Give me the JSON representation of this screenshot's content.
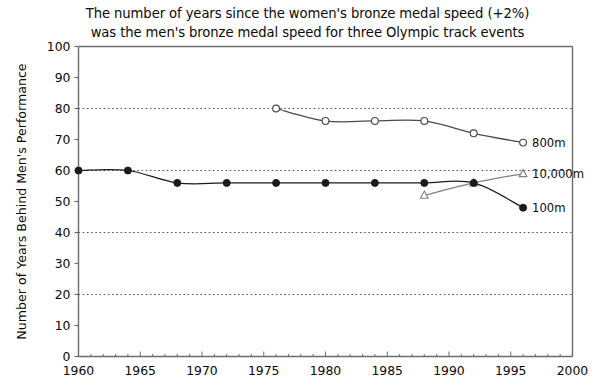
{
  "chart_data": {
    "type": "line",
    "title": "The number of years since the women's bronze medal speed (+2%) was the men's bronze medal speed for three Olympic track events",
    "title_lines": [
      "The number of years since the women's bronze medal speed (+2%)",
      "was the men's bronze medal speed for three Olympic track events"
    ],
    "xlabel": "",
    "ylabel": "Number of Years Behind Men's Performance",
    "xlim": [
      1960,
      2000
    ],
    "ylim": [
      0,
      100
    ],
    "xticks": [
      1960,
      1965,
      1970,
      1975,
      1980,
      1985,
      1990,
      1995,
      2000
    ],
    "xtick_labels": [
      "1960",
      "1965",
      "1970",
      "1975",
      "1980",
      "1985",
      "1990",
      "1995",
      "2000"
    ],
    "x_minor_tick_step": 1,
    "yticks": [
      0,
      10,
      20,
      30,
      40,
      50,
      60,
      70,
      80,
      90,
      100
    ],
    "ytick_labels": [
      "0",
      "10",
      "20",
      "30",
      "40",
      "50",
      "60",
      "70",
      "80",
      "90",
      "100"
    ],
    "gridlines_y": [
      20,
      40,
      60,
      80
    ],
    "grid": "horizontal-dotted",
    "legend_position": "inline-right-of-series-end",
    "series": [
      {
        "name": "800m",
        "label": "800m",
        "marker": "open-circle",
        "color": "#4a4a4a",
        "x": [
          1976,
          1980,
          1984,
          1988,
          1992,
          1996
        ],
        "values": [
          80,
          76,
          76,
          76,
          72,
          69
        ]
      },
      {
        "name": "10,000m",
        "label": "10,000m",
        "marker": "open-triangle",
        "color": "#808080",
        "x": [
          1988,
          1992,
          1996
        ],
        "values": [
          52,
          56,
          59
        ]
      },
      {
        "name": "100m",
        "label": "100m",
        "marker": "filled-circle",
        "color": "#1a1a1a",
        "x": [
          1960,
          1964,
          1968,
          1972,
          1976,
          1980,
          1984,
          1988,
          1992,
          1996
        ],
        "values": [
          60,
          60,
          56,
          56,
          56,
          56,
          56,
          56,
          56,
          48
        ]
      }
    ]
  },
  "colors": {
    "axis": "#6b6b6b",
    "grid": "#555555",
    "text": "#0a0a0a",
    "background": "#ffffff"
  }
}
